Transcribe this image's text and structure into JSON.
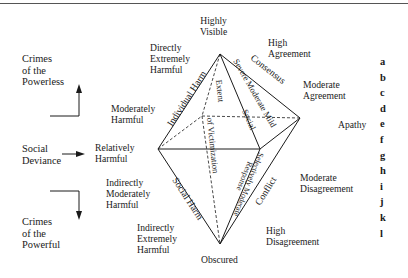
{
  "figure": {
    "left_column": {
      "crimes_of_powerless": "Crimes\nof the\nPowerless",
      "social_deviance": "Social\nDeviance",
      "crimes_of_powerful": "Crimes\nof the\nPowerful"
    },
    "harm_labels": {
      "directly_extremely_harmful": "Directly\nExtremely\nHarmful",
      "moderately_harmful": "Moderately\nHarmful",
      "relatively_harmful": "Relatively\nHarmful",
      "indirectly_moderately_harmful": "Indirectly\nModerately\nHarmful",
      "indirectly_extremely_harmful": "Indirectly\nExtremely\nHarmful"
    },
    "visibility": {
      "top": "Highly\nVisible",
      "bottom": "Obscured"
    },
    "agreement_labels": {
      "high_agreement": "High\nAgreement",
      "moderate_agreement": "Moderate\nAgreement",
      "apathy": "Apathy",
      "moderate_disagreement": "Moderate\nDisagreement",
      "high_disagreement": "High\nDisagreement"
    },
    "edge_labels": {
      "individual_harm": "Individual Harm",
      "social_harm": "Social Harm",
      "consensus": "Consensus",
      "conflict": "Conflict",
      "severe_moderate_mild": "Severe Moderate Mild",
      "social": "Social",
      "extent_of": "Extent",
      "of_victimization": "of Victimization",
      "selectively_moderate": "Selectively Moderate",
      "response": "Response"
    },
    "row_letters": [
      "a",
      "b",
      "c",
      "d",
      "e",
      "f",
      "g",
      "h",
      "i",
      "j",
      "k",
      "l"
    ]
  }
}
